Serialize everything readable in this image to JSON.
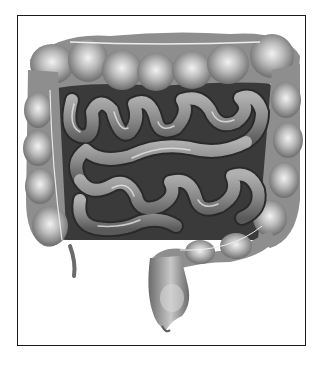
{
  "figure": {
    "style": "grayscale anatomical drawing",
    "frame_color": "#1a1a1a",
    "background_color": "#ffffff",
    "tones": {
      "colon_dark": "#6e6e6e",
      "colon_mid": "#9a9a9a",
      "colon_light": "#e4e4e4",
      "small_intestine": "#8a8a8a",
      "small_intestine_outline": "#2a2a2a",
      "cavity_shadow": "#3a3a3a"
    }
  }
}
